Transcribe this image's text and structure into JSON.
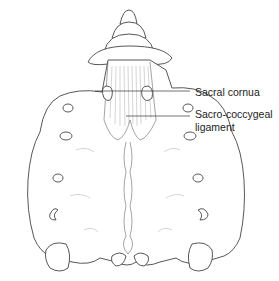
{
  "figure": {
    "labels": [
      {
        "id": "sacral-cornua",
        "text": "Sacral cornua"
      },
      {
        "id": "sacro-coccygeal-ligament",
        "line1": "Sacro-coccygeal",
        "line2": "ligament"
      }
    ]
  }
}
